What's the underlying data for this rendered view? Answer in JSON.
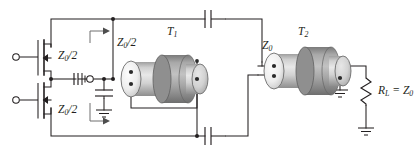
{
  "figure": {
    "type": "circuit-schematic",
    "title": "",
    "background_color": "#ffffff",
    "line_color": "#231f20",
    "coax_body_color": "#d4d4d4",
    "coax_bead_color": "#a3a3a3",
    "coax_face_color": "#f0f0f0"
  },
  "labels": {
    "z_half_upper": {
      "main": "Z",
      "sub": "0",
      "tail": "/2"
    },
    "z_half_lower": {
      "main": "Z",
      "sub": "0",
      "tail": "/2"
    },
    "z_half_mid": {
      "main": "Z",
      "sub": "0",
      "tail": "/2"
    },
    "z0_right": {
      "main": "Z",
      "sub": "0",
      "tail": ""
    },
    "t1": {
      "main": "T",
      "sub": "1"
    },
    "t2": {
      "main": "T",
      "sub": "2"
    },
    "load": {
      "main": "R",
      "sub": "L",
      "tail": " = Z",
      "tail_sub": "0"
    }
  },
  "label_text": {
    "z_half_upper": "Z0/2",
    "z_half_lower": "Z0/2",
    "z_half_mid": "Z0/2",
    "z0_right": "Z0",
    "t1": "T1",
    "t2": "T2",
    "load": "RL = Z0"
  },
  "components": [
    {
      "name": "mosfet-upper",
      "kind": "mosfet",
      "label": ""
    },
    {
      "name": "mosfet-lower",
      "kind": "mosfet",
      "label": ""
    },
    {
      "name": "input-terminal-upper",
      "kind": "terminal",
      "label": ""
    },
    {
      "name": "input-terminal-lower",
      "kind": "terminal",
      "label": ""
    },
    {
      "name": "input-terminal-mid",
      "kind": "terminal",
      "label": ""
    },
    {
      "name": "capacitor-shunt-mid",
      "kind": "capacitor",
      "label": ""
    },
    {
      "name": "capacitor-series-top",
      "kind": "capacitor",
      "label": ""
    },
    {
      "name": "capacitor-series-bottom",
      "kind": "capacitor",
      "label": ""
    },
    {
      "name": "ground-source",
      "kind": "ground",
      "label": ""
    },
    {
      "name": "ground-shunt-cap",
      "kind": "ground",
      "label": ""
    },
    {
      "name": "ground-t2-shield",
      "kind": "ground",
      "label": ""
    },
    {
      "name": "ground-load",
      "kind": "ground",
      "label": ""
    },
    {
      "name": "coax-transformer-t1",
      "kind": "transmission-line-transformer",
      "label": "T1"
    },
    {
      "name": "coax-transformer-t2",
      "kind": "transmission-line-transformer",
      "label": "T2"
    },
    {
      "name": "load-resistor",
      "kind": "resistor",
      "label": "RL = Z0"
    },
    {
      "name": "arrow-z-half-upper",
      "kind": "arrow",
      "label": ""
    },
    {
      "name": "arrow-z-half-lower",
      "kind": "arrow",
      "label": ""
    }
  ]
}
